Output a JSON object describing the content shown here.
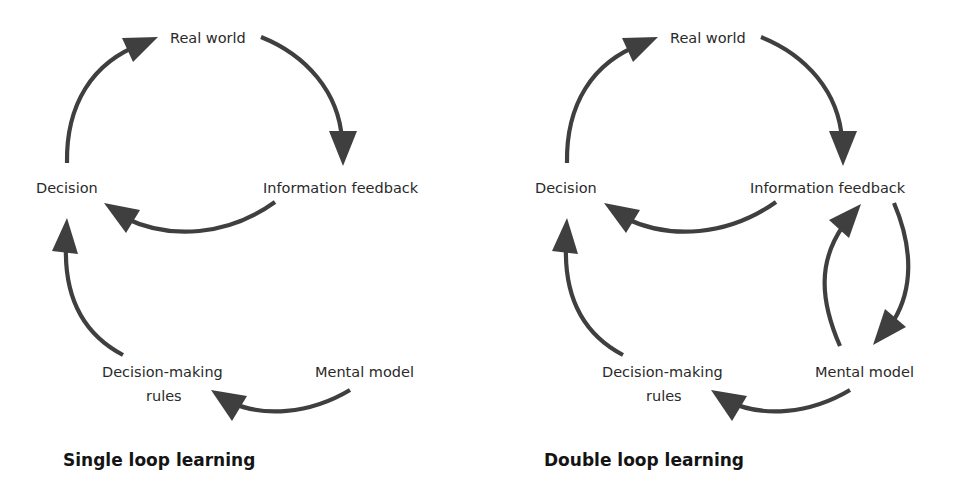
{
  "colors": {
    "arrow": "#3f3f3f",
    "text": "#2a2a2a",
    "caption": "#141414",
    "background": "#ffffff"
  },
  "diagrams": [
    {
      "id": "single",
      "caption": "Single loop learning",
      "nodes": {
        "real_world": "Real world",
        "information_feedback": "Information feedback",
        "decision": "Decision",
        "decision_making_rules_line1": "Decision-making",
        "decision_making_rules_line2": "rules",
        "mental_model": "Mental model"
      },
      "edges": [
        {
          "from": "Decision",
          "to": "Real world"
        },
        {
          "from": "Real world",
          "to": "Information feedback"
        },
        {
          "from": "Information feedback",
          "to": "Decision"
        },
        {
          "from": "Decision-making rules",
          "to": "Decision"
        },
        {
          "from": "Mental model",
          "to": "Decision-making rules"
        }
      ]
    },
    {
      "id": "double",
      "caption": "Double loop learning",
      "nodes": {
        "real_world": "Real world",
        "information_feedback": "Information feedback",
        "decision": "Decision",
        "decision_making_rules_line1": "Decision-making",
        "decision_making_rules_line2": "rules",
        "mental_model": "Mental model"
      },
      "edges": [
        {
          "from": "Decision",
          "to": "Real world"
        },
        {
          "from": "Real world",
          "to": "Information feedback"
        },
        {
          "from": "Information feedback",
          "to": "Decision"
        },
        {
          "from": "Decision-making rules",
          "to": "Decision"
        },
        {
          "from": "Mental model",
          "to": "Decision-making rules"
        },
        {
          "from": "Information feedback",
          "to": "Mental model"
        },
        {
          "from": "Mental model",
          "to": "Information feedback"
        }
      ]
    }
  ]
}
